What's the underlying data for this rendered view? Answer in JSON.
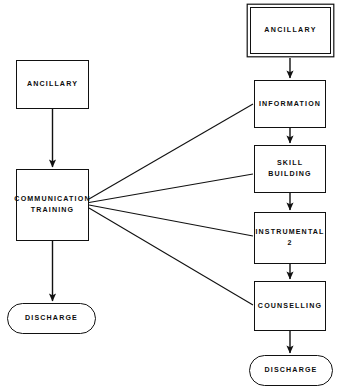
{
  "diagram": {
    "background_color": "#ffffff",
    "line_color": "#111111",
    "text_color": "#0d0d0d",
    "type": "flowchart",
    "branches": [
      {
        "name": "left-pathway",
        "sequence": [
          "ANCILLARY",
          "COMMUNICATION TRAINING",
          "DISCHARGE"
        ]
      },
      {
        "name": "right-pathway",
        "sequence": [
          "ANCILLARY",
          "INFORMATION",
          "SKILL BUILDING",
          "INSTRUMENTAL 2",
          "COUNSELLING",
          "DISCHARGE"
        ]
      }
    ]
  },
  "nodes": {
    "left_ancillary": {
      "label": "ANCILLARY",
      "shape": "rectangle",
      "x": 16,
      "y": 60,
      "w": 73,
      "h": 49
    },
    "communication_training": {
      "label": "COMMUNICATION\nTRAINING",
      "shape": "rectangle",
      "x": 16,
      "y": 169,
      "w": 73,
      "h": 72
    },
    "left_discharge": {
      "label": "DISCHARGE",
      "shape": "stadium",
      "x": 7,
      "y": 303,
      "w": 89,
      "h": 31
    },
    "right_ancillary": {
      "label": "ANCILLARY",
      "shape": "rectangle-double",
      "x": 250,
      "y": 7,
      "w": 81,
      "h": 47
    },
    "information": {
      "label": "INFORMATION",
      "shape": "rectangle",
      "x": 254,
      "y": 80,
      "w": 72,
      "h": 48
    },
    "skill_building": {
      "label": "SKILL\nBUILDING",
      "shape": "rectangle",
      "x": 254,
      "y": 145,
      "w": 72,
      "h": 48
    },
    "instrumental_2": {
      "label": "INSTRUMENTAL\n2",
      "shape": "rectangle",
      "x": 254,
      "y": 212,
      "w": 72,
      "h": 52
    },
    "counselling": {
      "label": "COUNSELLING",
      "shape": "rectangle",
      "x": 254,
      "y": 281,
      "w": 72,
      "h": 50
    },
    "right_discharge": {
      "label": "DISCHARGE",
      "shape": "stadium",
      "x": 249,
      "y": 355,
      "w": 84,
      "h": 31
    }
  },
  "edges": [
    {
      "name": "left-ancillary-to-communication-training",
      "kind": "arrow",
      "from": "left_ancillary",
      "to": "communication_training"
    },
    {
      "name": "communication-training-to-left-discharge",
      "kind": "arrow",
      "from": "communication_training",
      "to": "left_discharge"
    },
    {
      "name": "right-ancillary-to-information",
      "kind": "arrow",
      "from": "right_ancillary",
      "to": "information"
    },
    {
      "name": "information-to-skill-building",
      "kind": "arrow",
      "from": "information",
      "to": "skill_building"
    },
    {
      "name": "skill-building-to-instrumental-2",
      "kind": "arrow",
      "from": "skill_building",
      "to": "instrumental_2"
    },
    {
      "name": "instrumental-2-to-counselling",
      "kind": "arrow",
      "from": "instrumental_2",
      "to": "counselling"
    },
    {
      "name": "counselling-to-right-discharge",
      "kind": "arrow",
      "from": "counselling",
      "to": "right_discharge"
    },
    {
      "name": "communication-training-to-information",
      "kind": "line",
      "from": "communication_training",
      "to": "information"
    },
    {
      "name": "communication-training-to-skill-building",
      "kind": "line",
      "from": "communication_training",
      "to": "skill_building"
    },
    {
      "name": "communication-training-to-instrumental-2",
      "kind": "line",
      "from": "communication_training",
      "to": "instrumental_2"
    },
    {
      "name": "communication-training-to-counselling",
      "kind": "line",
      "from": "communication_training",
      "to": "counselling"
    }
  ]
}
